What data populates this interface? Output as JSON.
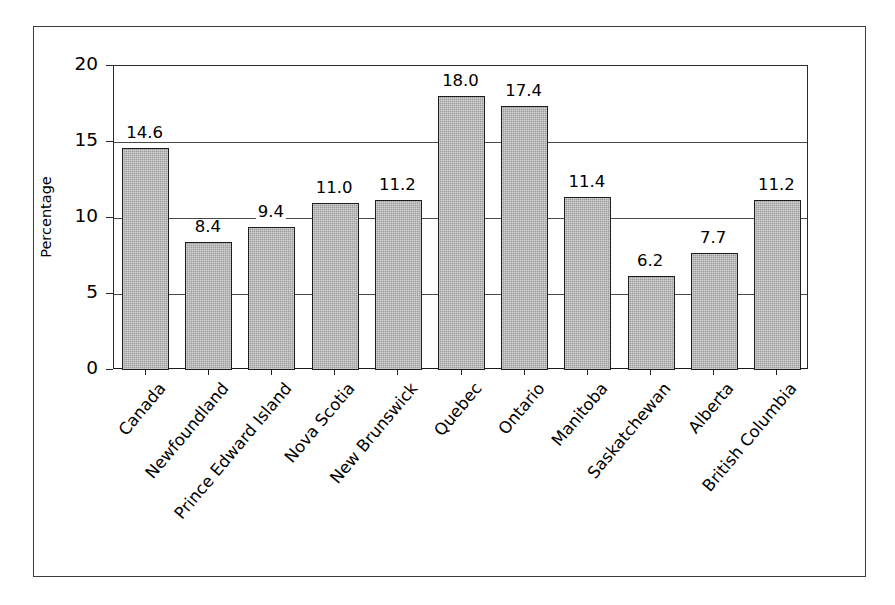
{
  "chart_data": {
    "type": "bar",
    "title": "",
    "xlabel": "",
    "ylabel": "Percentage",
    "ylim": [
      0,
      20
    ],
    "yticks": [
      0,
      5,
      10,
      15,
      20
    ],
    "ytick_labels": [
      "0",
      "5",
      "10",
      "15",
      "20"
    ],
    "grid": true,
    "grid_axis": "y",
    "legend": "none",
    "categories": [
      "Canada",
      "Newfoundland",
      "Prince Edward Island",
      "Nova Scotia",
      "New Brunswick",
      "Quebec",
      "Ontario",
      "Manitoba",
      "Saskatchewan",
      "Alberta",
      "British Columbia"
    ],
    "values": [
      14.6,
      8.4,
      9.4,
      11.0,
      11.2,
      18.0,
      17.4,
      11.4,
      6.2,
      7.7,
      11.2
    ],
    "value_labels": [
      "14.6",
      "8.4",
      "9.4",
      "11.0",
      "11.2",
      "18.0",
      "17.4",
      "11.4",
      "6.2",
      "7.7",
      "11.2"
    ],
    "bar_color": "#9d9d9d",
    "bar_edge_color": "#1e1e1e"
  }
}
